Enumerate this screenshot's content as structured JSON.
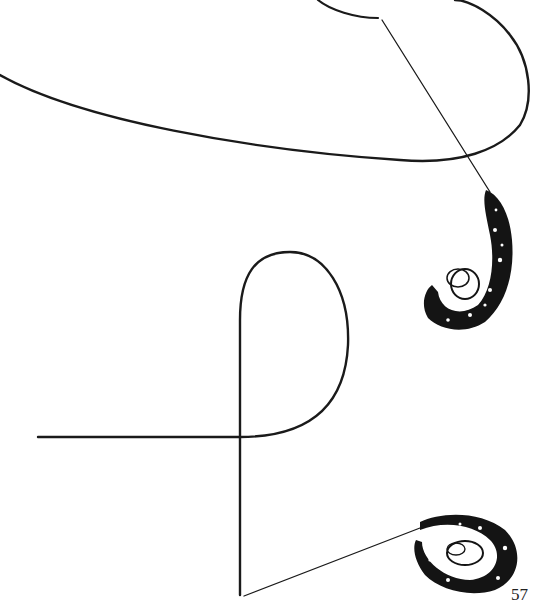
{
  "page": {
    "page_number": "57",
    "illustrations": [
      {
        "name": "upper-rope-loop-with-knot",
        "ink_color": "#1a1a1a"
      },
      {
        "name": "lower-rope-loop-with-knot",
        "ink_color": "#1a1a1a"
      }
    ]
  }
}
